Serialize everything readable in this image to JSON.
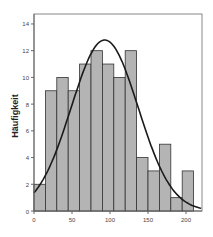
{
  "chart_data": {
    "type": "bar",
    "title": "",
    "xlabel": "",
    "ylabel": "Häufigkeit",
    "bin_width": 15,
    "bins": [
      {
        "start": 0,
        "end": 15,
        "count": 2
      },
      {
        "start": 15,
        "end": 30,
        "count": 9
      },
      {
        "start": 30,
        "end": 45,
        "count": 10
      },
      {
        "start": 45,
        "end": 60,
        "count": 9
      },
      {
        "start": 60,
        "end": 75,
        "count": 11
      },
      {
        "start": 75,
        "end": 90,
        "count": 12
      },
      {
        "start": 90,
        "end": 105,
        "count": 11
      },
      {
        "start": 105,
        "end": 120,
        "count": 10
      },
      {
        "start": 120,
        "end": 135,
        "count": 12
      },
      {
        "start": 135,
        "end": 150,
        "count": 4
      },
      {
        "start": 150,
        "end": 165,
        "count": 3
      },
      {
        "start": 165,
        "end": 180,
        "count": 5
      },
      {
        "start": 180,
        "end": 195,
        "count": 1
      },
      {
        "start": 195,
        "end": 210,
        "count": 3
      }
    ],
    "categories": [
      "0-15",
      "15-30",
      "30-45",
      "45-60",
      "60-75",
      "75-90",
      "90-105",
      "105-120",
      "120-135",
      "135-150",
      "150-165",
      "165-180",
      "180-195",
      "195-210"
    ],
    "values": [
      2,
      9,
      10,
      9,
      11,
      12,
      11,
      10,
      12,
      4,
      3,
      5,
      1,
      3
    ],
    "normal_curve": {
      "mean": 93,
      "sd": 44,
      "peak": 12.8
    },
    "xticks": [
      0,
      50,
      100,
      150,
      200
    ],
    "yticks": [
      0,
      2,
      4,
      6,
      8,
      10,
      12,
      14
    ],
    "xlim": [
      0,
      221
    ],
    "ylim": [
      0,
      14.8
    ],
    "grid": false,
    "legend": null,
    "colors": {
      "bar_fill": "#b4b4b4",
      "bar_edge": "#333333",
      "curve": "#1a1a1a",
      "frame": "#888888"
    }
  }
}
